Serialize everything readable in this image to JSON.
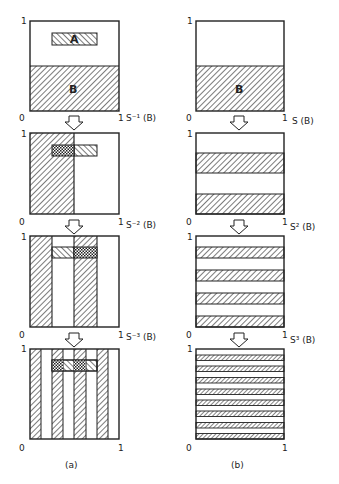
{
  "figure": {
    "columns": [
      {
        "id": "a",
        "caption": "(a)",
        "panels": [
          {
            "map_label": "S⁻¹ (B)",
            "region_a_label": "A",
            "region_b_label": "B"
          },
          {
            "map_label": "S⁻² (B)"
          },
          {
            "map_label": "S⁻³ (B)"
          },
          {
            "map_label": ""
          }
        ]
      },
      {
        "id": "b",
        "caption": "(b)",
        "panels": [
          {
            "map_label": "S (B)",
            "region_b_label": "B"
          },
          {
            "map_label": "S² (B)"
          },
          {
            "map_label": "S³ (B)"
          },
          {
            "map_label": ""
          }
        ]
      }
    ],
    "axis_labels": {
      "origin": "0",
      "one": "1"
    },
    "arrow_icon": "down-arrow-icon",
    "stroke_color": "#222222",
    "background": "#ffffff"
  }
}
